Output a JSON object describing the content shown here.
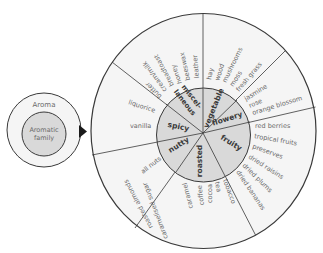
{
  "legend": {
    "outer_label": "Aroma",
    "inner_label_line1": "Aromatic",
    "inner_label_line2": "family"
  },
  "colors": {
    "outer_fill": "#f5f5f5",
    "inner_fill": "#d9d9d9",
    "stroke": "#3a3a3a",
    "arrow": "#1a1a1a"
  },
  "wheel": {
    "families": [
      {
        "name": "misc",
        "label_line1": "miscel-",
        "label_line2": "laneous"
      },
      {
        "name": "vegetable",
        "label": "vegetable"
      },
      {
        "name": "flowery",
        "label": "flowery"
      },
      {
        "name": "fruity",
        "label": "fruity"
      },
      {
        "name": "roasted",
        "label": "roasted"
      },
      {
        "name": "nutty",
        "label": "nutty"
      },
      {
        "name": "spicy",
        "label": "spicy"
      }
    ],
    "aromas": {
      "miscellaneous": [
        "leather",
        "beeswax",
        "honey",
        "breadtoast",
        "cream/milk",
        "butter"
      ],
      "vegetable": [
        "hay",
        "wood",
        "mushrooms",
        "moss",
        "fresh grass"
      ],
      "flowery": [
        "jasmine",
        "rose",
        "orange blossom"
      ],
      "fruity": [
        "red berries",
        "tropical fruits",
        "preserves",
        "dried raisins",
        "dried plums",
        "dried bananas"
      ],
      "roasted": [
        "tobacco",
        "tea",
        "cocoa",
        "coffee",
        "caramel",
        "caramelised sugar",
        "roasted almonds"
      ],
      "nutty": [
        "all nuts"
      ],
      "spicy": [
        "liquorice",
        "vanilla"
      ]
    }
  }
}
